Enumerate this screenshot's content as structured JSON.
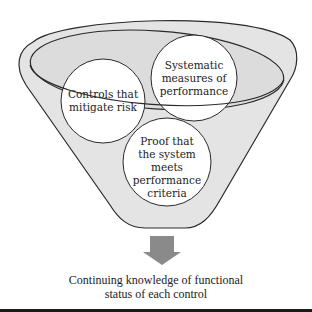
{
  "diagram": {
    "type": "funnel",
    "colors": {
      "funnel_fill": "#e4e4e4",
      "funnel_stroke": "#2a2a2a",
      "circle_fill": "#ffffff",
      "arrow": "#8a8a8a",
      "bottom_bar": "#1a1a1a"
    },
    "circles": [
      {
        "id": "controls",
        "label_lines": [
          "Controls that",
          "mitigate risk"
        ]
      },
      {
        "id": "systematic",
        "label_lines": [
          "Systematic",
          "measures of",
          "performance"
        ]
      },
      {
        "id": "proof",
        "label_lines": [
          "Proof that",
          "the system",
          "meets",
          "performance",
          "criteria"
        ]
      }
    ],
    "arrow": {
      "direction": "down",
      "icon": "down-arrow-icon"
    },
    "output": {
      "label_lines": [
        "Continuing knowledge of functional",
        "status of each control"
      ]
    }
  }
}
